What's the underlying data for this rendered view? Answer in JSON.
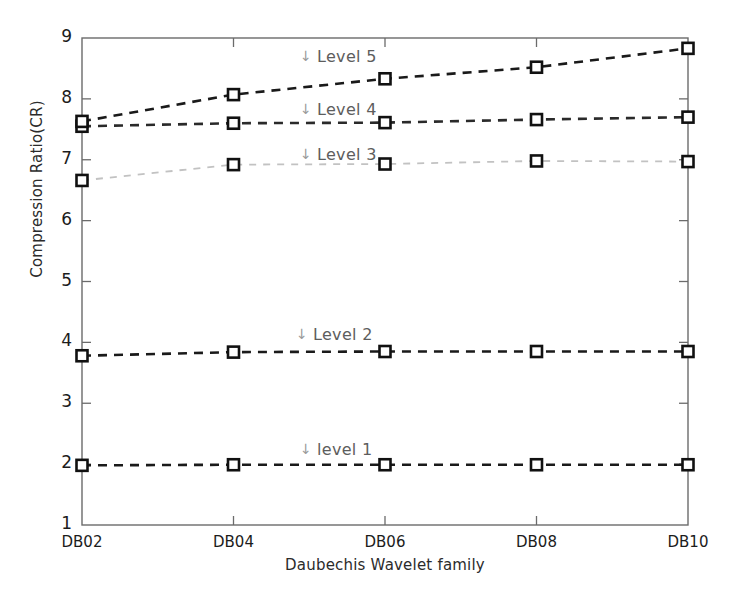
{
  "chart_data": {
    "type": "line",
    "title": "",
    "xlabel": "Daubechis Wavelet family",
    "ylabel": "Compression Ratio(CR)",
    "categories": [
      "DB02",
      "DB04",
      "DB06",
      "DB08",
      "DB10"
    ],
    "ylim": [
      1,
      9
    ],
    "yticks": [
      1,
      2,
      3,
      4,
      5,
      6,
      7,
      8,
      9
    ],
    "ytick_labels": [
      "1",
      "2",
      "3",
      "4",
      "5",
      "6",
      "7",
      "8",
      "9"
    ],
    "grid": false,
    "legend_position": "inline-annotations",
    "marker": "open-square",
    "linestyle": "dashed",
    "series": [
      {
        "name": "level 1",
        "annotation": "level 1",
        "color": "#1a1a1a",
        "values": [
          1.98,
          1.99,
          1.99,
          1.99,
          1.99
        ]
      },
      {
        "name": "Level 2",
        "annotation": "Level 2",
        "color": "#1a1a1a",
        "values": [
          3.78,
          3.84,
          3.85,
          3.85,
          3.85
        ]
      },
      {
        "name": "Level 3",
        "annotation": "Level 3",
        "color": "#c2c2c2",
        "values": [
          6.66,
          6.92,
          6.93,
          6.98,
          6.97
        ]
      },
      {
        "name": "Level 4",
        "annotation": "Level 4",
        "color": "#2a2a2a",
        "values": [
          7.55,
          7.6,
          7.61,
          7.66,
          7.7
        ]
      },
      {
        "name": "Level 5",
        "annotation": "Level 5",
        "color": "#1a1a1a",
        "values": [
          7.63,
          8.07,
          8.33,
          8.52,
          8.83
        ]
      }
    ],
    "annotations": [
      {
        "text": "Level 5",
        "icon": "down-arrow-icon",
        "x_px": 300,
        "y_px": 47
      },
      {
        "text": "Level 4",
        "icon": "down-arrow-icon",
        "x_px": 300,
        "y_px": 100
      },
      {
        "text": "Level 3",
        "icon": "down-arrow-icon",
        "x_px": 300,
        "y_px": 145
      },
      {
        "text": "Level 2",
        "icon": "down-arrow-icon",
        "x_px": 296,
        "y_px": 325
      },
      {
        "text": "level 1",
        "icon": "down-arrow-icon",
        "x_px": 300,
        "y_px": 440
      }
    ],
    "arrow_glyph": "↓",
    "frame_color": "#6b6b6b",
    "background": "#ffffff"
  }
}
